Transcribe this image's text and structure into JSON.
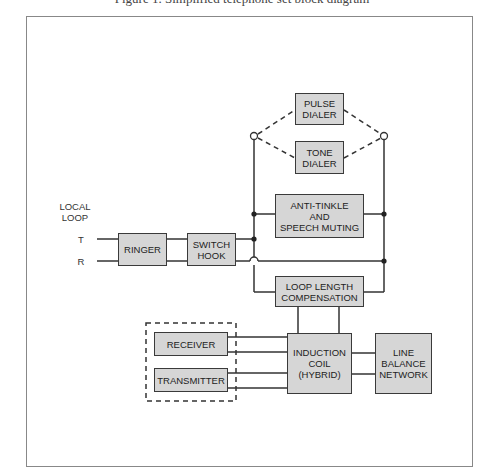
{
  "caption": "Figure 1. Simplified telephone set block diagram",
  "colors": {
    "box_fill": "#d6d6d6",
    "box_border": "#3a3a3a",
    "line": "#333333",
    "frame": "#888888"
  },
  "labels": {
    "local_loop": "LOCAL\nLOOP",
    "tip": "T",
    "ring": "R"
  },
  "blocks": {
    "pulse_dialer": "PULSE\nDIALER",
    "tone_dialer": "TONE\nDIALER",
    "ringer": "RINGER",
    "switch_hook": "SWITCH\nHOOK",
    "anti_tinkle": "ANTI-TINKLE\nAND\nSPEECH MUTING",
    "loop_length": "LOOP LENGTH\nCOMPENSATION",
    "receiver": "RECEIVER",
    "transmitter": "TRANSMITTER",
    "induction_coil": "INDUCTION\nCOIL\n(HYBRID)",
    "line_balance": "LINE\nBALANCE\nNETWORK"
  }
}
